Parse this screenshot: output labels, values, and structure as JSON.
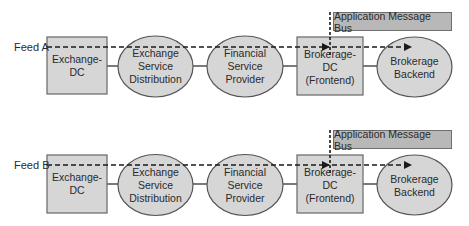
{
  "colors": {
    "box_fill": "#d6d6d6",
    "ellipse_fill": "#d6d6d6",
    "bus_fill": "#b8b8b8",
    "stroke": "#555555",
    "dash": "#1a1a1a"
  },
  "rows": [
    {
      "feed_label": "Feed A",
      "bus_label": "Application Message Bus",
      "nodes": {
        "exchange_dc": "Exchange-DC",
        "exchange_service": "Exchange\nService\nDistribution",
        "financial_service": "Financial\nService\nProvider",
        "brokerage_dc": "Brokerage-\nDC (Frontend)",
        "brokerage_backend": "Brokerage\nBackend"
      }
    },
    {
      "feed_label": "Feed B",
      "bus_label": "Application Message Bus",
      "nodes": {
        "exchange_dc": "Exchange-DC",
        "exchange_service": "Exchange\nService\nDistribution",
        "financial_service": "Financial\nService\nProvider",
        "brokerage_dc": "Brokerage-\nDC (Frontend)",
        "brokerage_backend": "Brokerage\nBackend"
      }
    }
  ]
}
